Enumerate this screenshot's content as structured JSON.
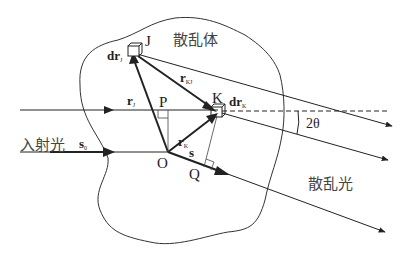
{
  "diagram": {
    "region_labels": {
      "scatterer": "散乱体",
      "incident": "入射光",
      "scattered": "散乱光"
    },
    "points": {
      "J": "J",
      "K": "K",
      "O": "O",
      "P": "P",
      "Q": "Q"
    },
    "vectors": {
      "r_J": {
        "main": "r",
        "sub": "J"
      },
      "r_K": {
        "main": "r",
        "sub": "K"
      },
      "r_KJ": {
        "main": "r",
        "sub": "KJ"
      },
      "s0": {
        "main": "s",
        "sub": "0"
      },
      "s": {
        "main": "s",
        "sub": ""
      },
      "dr_J": {
        "main": "dr",
        "sub": "J"
      },
      "dr_K": {
        "main": "dr",
        "sub": "K"
      }
    },
    "angle": "2θ",
    "colors": {
      "line": "#222222",
      "text": "#333333",
      "background": "#ffffff"
    }
  }
}
